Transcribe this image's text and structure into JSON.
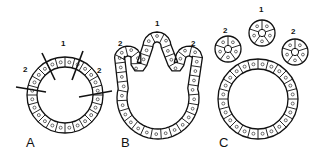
{
  "diagram": {
    "panels": [
      {
        "id": "A",
        "label": "A",
        "site_label": "1",
        "side_labels": [
          "2",
          "2"
        ],
        "description": "ring of cells with cut lines marking budding sites"
      },
      {
        "id": "B",
        "label": "B",
        "site_label": "1",
        "side_labels": [
          "2",
          "2"
        ],
        "description": "epithelium with three evaginating lobes"
      },
      {
        "id": "C",
        "label": "C",
        "site_label": "1",
        "side_labels": [
          "2",
          "2"
        ],
        "description": "ring with three separated rosette buds"
      }
    ],
    "colors": {
      "line": "#111111",
      "background": "#ffffff"
    }
  }
}
